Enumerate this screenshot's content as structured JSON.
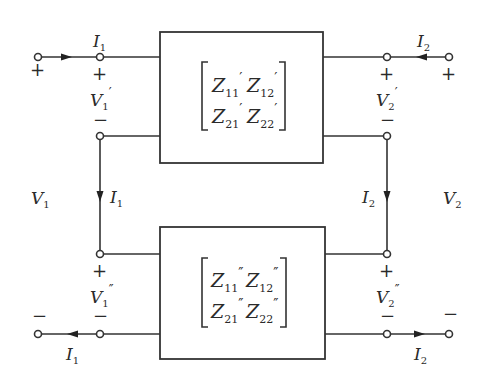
{
  "figure": {
    "type": "series connection of two two-port networks (Z-parameters)",
    "port1": {
      "voltage_label": "V",
      "voltage_sub": "1",
      "current_label": "I",
      "current_sub": "1",
      "plus": "+",
      "minus": "−"
    },
    "port2": {
      "voltage_label": "V",
      "voltage_sub": "2",
      "current_label": "I",
      "current_sub": "2",
      "plus": "+",
      "minus": "−"
    },
    "top_network": {
      "prime": "′",
      "v1_label": "V",
      "v1_sub": "1",
      "v2_label": "V",
      "v2_sub": "2",
      "matrix": [
        [
          {
            "z": "Z",
            "sub": "11"
          },
          {
            "z": "Z",
            "sub": "12"
          }
        ],
        [
          {
            "z": "Z",
            "sub": "21"
          },
          {
            "z": "Z",
            "sub": "22"
          }
        ]
      ]
    },
    "bottom_network": {
      "prime": "″",
      "v1_label": "V",
      "v1_sub": "1",
      "v2_label": "V",
      "v2_sub": "2",
      "matrix": [
        [
          {
            "z": "Z",
            "sub": "11"
          },
          {
            "z": "Z",
            "sub": "12"
          }
        ],
        [
          {
            "z": "Z",
            "sub": "21"
          },
          {
            "z": "Z",
            "sub": "22"
          }
        ]
      ]
    },
    "colors": {
      "line": "#333333",
      "background": "#ffffff"
    }
  }
}
